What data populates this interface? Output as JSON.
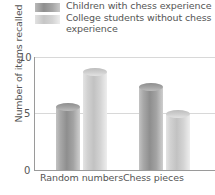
{
  "chart_data": {
    "type": "bar",
    "title": "",
    "xlabel": "",
    "ylabel": "Number of items recalled",
    "categories": [
      "Random numbers",
      "Chess pieces"
    ],
    "series": [
      {
        "name": "Children with chess experience",
        "color": "#9a9a9a",
        "values": [
          5.9,
          7.7
        ]
      },
      {
        "name": "College students without chess experience",
        "color": "#cfcfcf",
        "values": [
          9.0,
          5.3
        ]
      }
    ],
    "ylim": [
      0,
      10.5
    ],
    "yticks": [
      0,
      5,
      10
    ],
    "ytick_labels": [
      "0",
      "5",
      "10"
    ],
    "grid": "horizontal",
    "legend_position": "top"
  },
  "legend": {
    "items": [
      {
        "label": "Children with chess experience",
        "swatch": "dark-gray-swatch"
      },
      {
        "label": "College students without chess\nexperience",
        "swatch": "light-gray-swatch"
      }
    ]
  },
  "axis": {
    "y_title": "Number of items recalled",
    "y_ticks": [
      "10",
      "5",
      "0"
    ],
    "x_categories": [
      "Random numbers",
      "Chess pieces"
    ]
  }
}
